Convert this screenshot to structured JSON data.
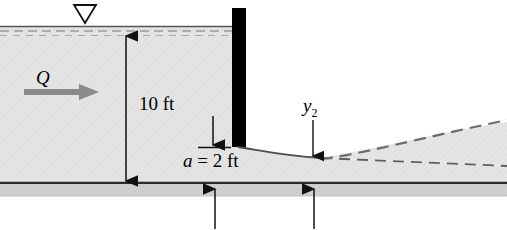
{
  "figure": {
    "labels": {
      "upstream_depth": "10 ft",
      "gate_opening": "a = 2 ft",
      "gate_opening_symbol": "a",
      "gate_opening_value": " = 2 ft",
      "discharge": "Q",
      "downstream_depth": "y",
      "downstream_depth_sub": "2"
    },
    "icons": {
      "water_surface_symbol": "water-surface-triangle-icon",
      "flow_arrow": "flow-direction-arrow-icon",
      "dimension_arrow": "dimension-arrow-icon",
      "section_arrow": "section-marker-arrow-icon"
    },
    "colors": {
      "water_fill": "#e3e3e3",
      "bed_fill": "#cfcfcf",
      "gate": "#000000",
      "line": "#1a1a1a",
      "flow_arrow": "#808080",
      "dashed": "#6e6e6e"
    },
    "geometry": {
      "water_surface_y": 26,
      "channel_bed_y": 183,
      "gate_x": 238,
      "gate_opening_y": 147,
      "upstream_depth_ft": 10,
      "gate_opening_ft": 2
    }
  }
}
